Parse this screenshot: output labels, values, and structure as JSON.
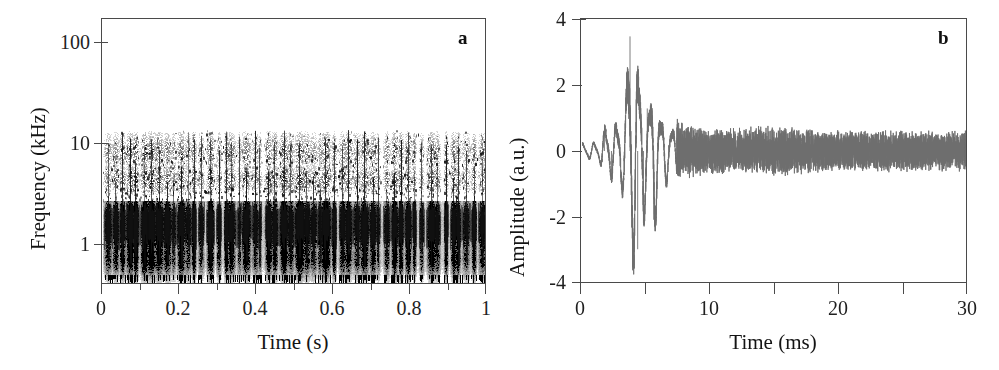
{
  "figure": {
    "width": 999,
    "height": 370,
    "background": "#ffffff"
  },
  "chart_data": [
    {
      "type": "heatmap",
      "panel_label": "a",
      "title": "",
      "xlabel": "Time (s)",
      "ylabel": "Frequency (kHz)",
      "xlim": [
        0,
        1
      ],
      "ylim": [
        0.3,
        160
      ],
      "yscale": "log",
      "xscale": "linear",
      "grid": false,
      "legend": "none",
      "xticks": [
        0,
        0.1,
        0.2,
        0.3,
        0.4,
        0.5,
        0.6,
        0.7,
        0.8,
        0.9,
        1
      ],
      "xtick_labels": [
        "0",
        "",
        "0.2",
        "",
        "0.4",
        "",
        "0.6",
        "",
        "0.8",
        "",
        "1"
      ],
      "yticks": [
        1,
        10,
        100
      ],
      "ytick_labels": [
        "1",
        "10",
        "100"
      ],
      "colormap": "grayscale-inverted",
      "description": "Spectrogram of a bioacoustic signal: dense saturated black energy band centred near 1 kHz, intermittent speckled harmonic energy between 2 and 10 kHz, strong vertical pulse striping across the full 1 s record, empty (white) above about 12 kHz.",
      "bands": [
        {
          "name": "fundamental",
          "center_khz": 1.15,
          "bandwidth_khz": 0.95,
          "intensity": 1.0
        },
        {
          "name": "sub-band",
          "center_khz": 0.55,
          "bandwidth_khz": 0.35,
          "intensity": 0.75
        },
        {
          "name": "harmonic-2",
          "center_khz": 3.6,
          "bandwidth_khz": 1.3,
          "intensity": 0.5
        },
        {
          "name": "harmonic-3",
          "center_khz": 7.0,
          "bandwidth_khz": 3.0,
          "intensity": 0.45
        },
        {
          "name": "upper-edge",
          "center_khz": 10.5,
          "bandwidth_khz": 1.2,
          "intensity": 0.2
        }
      ],
      "pulse_rate_hz": 52,
      "ink_color": "#101010"
    },
    {
      "type": "line",
      "panel_label": "b",
      "title": "",
      "xlabel": "Time (ms)",
      "ylabel": "Amplitude (a.u.)",
      "xlim": [
        0,
        30
      ],
      "ylim": [
        -4,
        4
      ],
      "grid": false,
      "legend": "none",
      "xticks": [
        0,
        5,
        10,
        15,
        20,
        25,
        30
      ],
      "xtick_labels": [
        "0",
        "",
        "10",
        "",
        "20",
        "",
        "30"
      ],
      "yticks": [
        -4,
        -2,
        0,
        2,
        4
      ],
      "ytick_labels": [
        "-4",
        "-2",
        "0",
        "2",
        "4"
      ],
      "line_color": "#6e6e6e",
      "line_width": 0.9,
      "description": "Single oscillogram trace of one pulse: low-level noise until about 1.5 ms, a first small negative-positive excursion near 2 ms, a dominant transient between 3 and 7 ms reaching +3.5 and -3.0 a.u., then an exponentially decaying ringing settling into a steady broadband noise floor of roughly +/-0.45 a.u. out to 30 ms.",
      "envelope_keypoints": [
        {
          "t_ms": 0.0,
          "amp": 0.22
        },
        {
          "t_ms": 1.2,
          "amp": 0.26
        },
        {
          "t_ms": 1.9,
          "amp": 0.78
        },
        {
          "t_ms": 2.6,
          "amp": 0.85
        },
        {
          "t_ms": 3.2,
          "amp": 1.2
        },
        {
          "t_ms": 3.75,
          "amp": 3.5
        },
        {
          "t_ms": 4.2,
          "amp": 3.0
        },
        {
          "t_ms": 4.7,
          "amp": 2.2
        },
        {
          "t_ms": 5.1,
          "amp": 1.35
        },
        {
          "t_ms": 5.6,
          "amp": 2.1
        },
        {
          "t_ms": 6.2,
          "amp": 1.05
        },
        {
          "t_ms": 7.0,
          "amp": 0.75
        },
        {
          "t_ms": 8.0,
          "amp": 0.55
        },
        {
          "t_ms": 10.0,
          "amp": 0.45
        },
        {
          "t_ms": 15.0,
          "amp": 0.5
        },
        {
          "t_ms": 20.0,
          "amp": 0.42
        },
        {
          "t_ms": 25.0,
          "amp": 0.42
        },
        {
          "t_ms": 30.0,
          "amp": 0.4
        }
      ],
      "peaks": [
        {
          "t_ms": 3.75,
          "amp": 3.5,
          "kind": "max"
        },
        {
          "t_ms": 4.35,
          "amp": -3.0,
          "kind": "min"
        },
        {
          "t_ms": 5.1,
          "amp": 1.3,
          "kind": "max"
        },
        {
          "t_ms": 4.8,
          "amp": -2.2,
          "kind": "min"
        },
        {
          "t_ms": 5.6,
          "amp": -2.1,
          "kind": "min"
        },
        {
          "t_ms": 2.3,
          "amp": -0.85,
          "kind": "min"
        },
        {
          "t_ms": 1.75,
          "amp": 0.55,
          "kind": "max"
        }
      ]
    }
  ],
  "panel_a": {
    "letter": "a",
    "xlabel": "Time (s)",
    "ylabel": "Frequency (kHz)",
    "xtick_labels": [
      "0",
      "0.2",
      "0.4",
      "0.6",
      "0.8",
      "1"
    ],
    "ytick_labels": [
      "100",
      "10",
      "1"
    ]
  },
  "panel_b": {
    "letter": "b",
    "xlabel": "Time (ms)",
    "ylabel": "Amplitude (a.u.)",
    "xtick_labels": [
      "0",
      "10",
      "20",
      "30"
    ],
    "ytick_labels": [
      "4",
      "2",
      "0",
      "-2",
      "-4"
    ]
  }
}
